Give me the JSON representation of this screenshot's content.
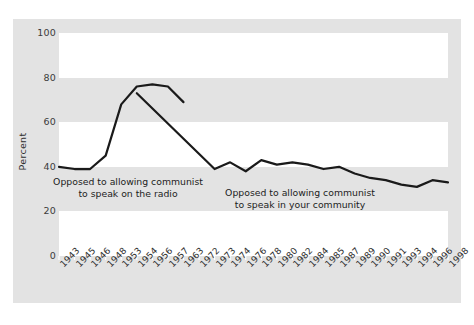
{
  "chart_data": {
    "type": "line",
    "title": "",
    "subtitle": "",
    "xlabel": "",
    "ylabel": "Percent",
    "ylim": [
      0,
      100
    ],
    "yticks": [
      0,
      20,
      40,
      60,
      80,
      100
    ],
    "ytick_labels": [
      "0",
      "20",
      "40",
      "60",
      "80",
      "100"
    ],
    "grid": "horizontal-bands",
    "legend_position": "inline-annotations",
    "categories": [
      "1943",
      "1945",
      "1946",
      "1948",
      "1953",
      "1954",
      "1956",
      "1957",
      "1963",
      "1972",
      "1973",
      "1974",
      "1976",
      "1978",
      "1980",
      "1982",
      "1984",
      "1985",
      "1987",
      "1989",
      "1990",
      "1991",
      "1993",
      "1994",
      "1996",
      "1998"
    ],
    "series": [
      {
        "name": "Opposed to allowing communist to speak on the radio",
        "color": "#1a1a1a",
        "x": [
          "1943",
          "1945",
          "1946",
          "1948",
          "1953",
          "1954",
          "1956",
          "1957",
          "1963"
        ],
        "values": [
          40,
          39,
          39,
          45,
          68,
          76,
          77,
          76,
          69
        ]
      },
      {
        "name": "Opposed to allowing communist to speak in your community",
        "color": "#1a1a1a",
        "x": [
          "1954",
          "1973",
          "1974",
          "1976",
          "1978",
          "1980",
          "1982",
          "1984",
          "1985",
          "1987",
          "1989",
          "1990",
          "1991",
          "1993",
          "1994",
          "1996",
          "1998"
        ],
        "values": [
          73,
          39,
          42,
          38,
          43,
          41,
          42,
          41,
          39,
          40,
          37,
          35,
          34,
          32,
          31,
          34,
          33
        ]
      }
    ],
    "annotations": [
      {
        "id": "annotation-radio",
        "line1": "Opposed to allowing communist",
        "line2": "to speak on the radio"
      },
      {
        "id": "annotation-community",
        "line1": "Opposed to allowing communist",
        "line2": "to speak in your community"
      }
    ],
    "colors": {
      "panel_background": "#e3e3e3",
      "band_background": "#ffffff",
      "line": "#1a1a1a",
      "tick_text": "#2f2f2f",
      "figure_background": "#ffffff"
    }
  }
}
